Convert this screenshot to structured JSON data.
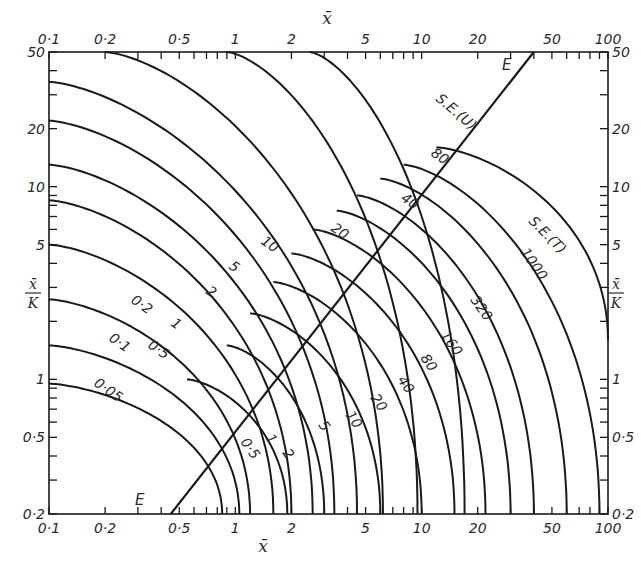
{
  "chart_data": {
    "type": "line",
    "title": "",
    "xlabel": "x̄",
    "ylabel": "x̄/K",
    "x_scale": "log",
    "y_scale": "log",
    "xlim": [
      0.1,
      100
    ],
    "ylim": [
      0.2,
      50
    ],
    "x_ticks_top": [
      "0·1",
      "0·2",
      "0·5",
      "1",
      "2",
      "5",
      "10",
      "20",
      "50",
      "100"
    ],
    "x_ticks_bottom": [
      "0·1",
      "0·2",
      "0·5",
      "1",
      "2",
      "5",
      "10",
      "20",
      "50",
      "100"
    ],
    "y_ticks_left": [
      "50",
      "20",
      "10",
      "5",
      "1",
      "0·5",
      "0·2"
    ],
    "y_ticks_right": [
      "50",
      "20",
      "10",
      "5",
      "1",
      "0·5",
      "0·2"
    ],
    "reference_line": {
      "label": "E",
      "from": [
        0.45,
        0.2
      ],
      "to": [
        40,
        50
      ]
    },
    "families": [
      {
        "name": "S.E.(U)",
        "labels": [
          "0·05",
          "0·1",
          "0·2",
          "0·5",
          "1",
          "2",
          "5",
          "10",
          "20",
          "40",
          "80"
        ],
        "values": [
          0.05,
          0.1,
          0.2,
          0.5,
          1,
          2,
          5,
          10,
          20,
          40,
          80
        ]
      },
      {
        "name": "S.E.(T)",
        "labels": [
          "0·5",
          "1",
          "2",
          "5",
          "10",
          "20",
          "40",
          "80",
          "160",
          "320",
          "1000"
        ],
        "values": [
          0.5,
          1,
          2,
          5,
          10,
          20,
          40,
          80,
          160,
          320,
          1000
        ]
      }
    ],
    "grid": false,
    "legend": "none"
  },
  "labels": {
    "x_axis_top": "x̄",
    "x_axis_bottom": "x̄",
    "y_axis_left_num": "x̄",
    "y_axis_left_den": "K",
    "y_axis_right_num": "x̄",
    "y_axis_right_den": "K",
    "line_e_top": "E",
    "line_e_bottom": "E",
    "family_u_name": "S.E.(U)",
    "family_t_name": "S.E.(T)"
  }
}
